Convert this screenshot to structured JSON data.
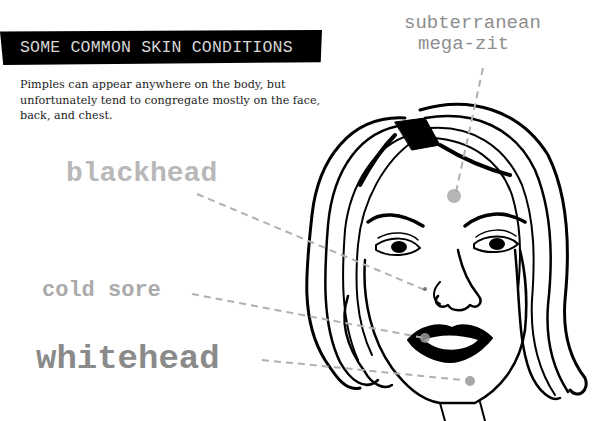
{
  "header": {
    "title": "SOME COMMON SKIN CONDITIONS"
  },
  "intro": {
    "text": "Pimples can appear anywhere on the body, but unfortunately tend to congregate mostly on the face, back, and chest."
  },
  "labels": {
    "mega_zit_line1": "subterranean",
    "mega_zit_line2": "mega-zit",
    "blackhead": "blackhead",
    "cold_sore": "cold sore",
    "whitehead": "whitehead"
  },
  "colors": {
    "header_bg": "#000000",
    "header_text": "#d6d6d6",
    "leader_line": "#b0b0b0",
    "blemish": "#a8a8a8"
  }
}
